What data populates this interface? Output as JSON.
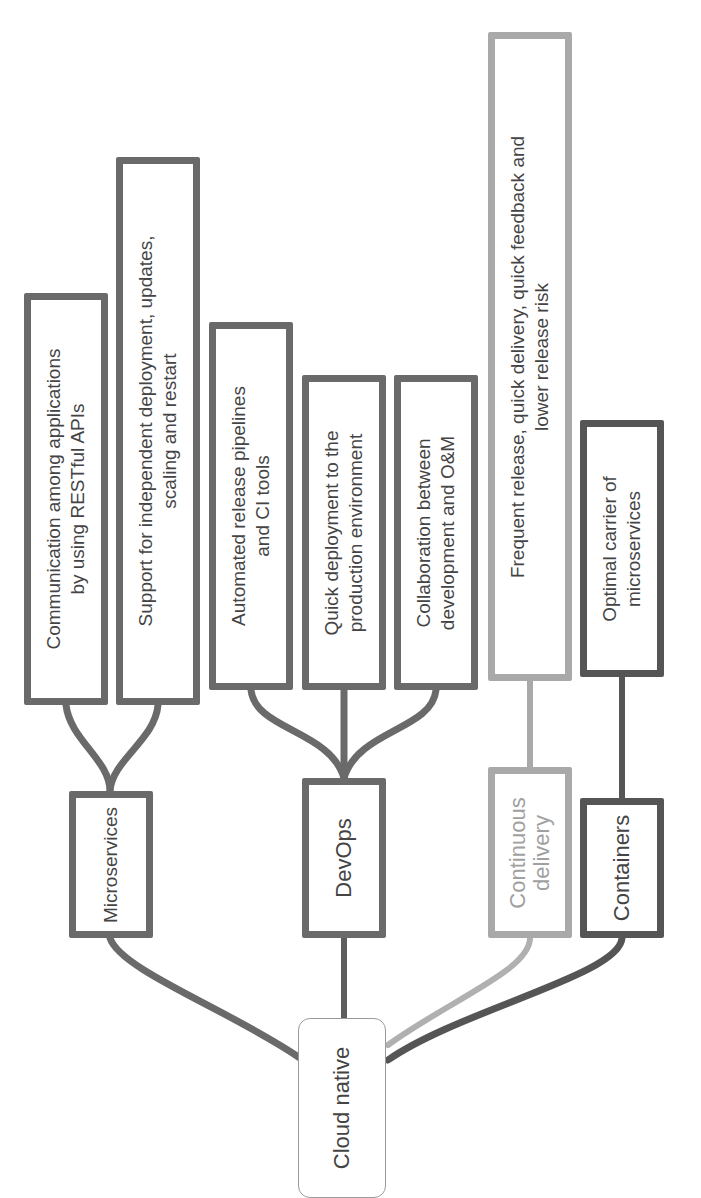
{
  "diagram": {
    "root": {
      "label": "Cloud native"
    },
    "branches": [
      {
        "label": "Microservices",
        "color": "#6a6a6a",
        "children": [
          {
            "lines": [
              "Communication among applications",
              "by using RESTful APIs"
            ]
          },
          {
            "lines": [
              "Support for independent deployment, updates,",
              "scaling and restart"
            ]
          }
        ]
      },
      {
        "label": "DevOps",
        "color": "#6a6a6a",
        "children": [
          {
            "lines": [
              "Automated release pipelines",
              "and CI tools"
            ]
          },
          {
            "lines": [
              "Quick deployment to the",
              "production environment"
            ]
          },
          {
            "lines": [
              "Collaboration between",
              "development and O&M"
            ]
          }
        ]
      },
      {
        "label_lines": [
          "Continuous",
          "delivery"
        ],
        "color": "#a9a9a9",
        "children": [
          {
            "lines": [
              "Frequent release, quick delivery, quick feedback and",
              "lower release risk"
            ],
            "stray_mark": ","
          }
        ]
      },
      {
        "label": "Containers",
        "color": "#555555",
        "children": [
          {
            "lines": [
              "Optimal carrier of",
              "microservices"
            ]
          }
        ]
      }
    ]
  },
  "orientation": "rotated -90deg (text reads bottom-to-top)"
}
